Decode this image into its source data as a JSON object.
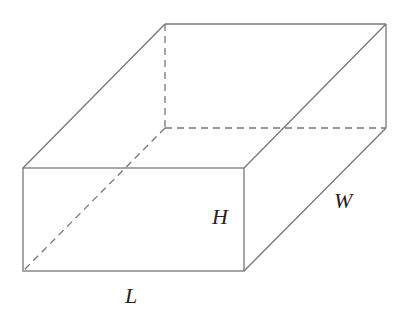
{
  "diagram": {
    "colors": {
      "edge": "#777777",
      "label": "#222222"
    },
    "vertices": {
      "front_top_left": [
        23,
        168
      ],
      "front_top_right": [
        244,
        168
      ],
      "front_bottom_left": [
        23,
        271
      ],
      "front_bottom_right": [
        244,
        271
      ],
      "back_top_left": [
        165,
        24
      ],
      "back_top_right": [
        386,
        24
      ],
      "back_bottom_left": [
        165,
        128
      ],
      "back_bottom_right": [
        386,
        128
      ]
    },
    "labels": {
      "height": {
        "text": "H",
        "x": 212,
        "y": 224
      },
      "width": {
        "text": "W",
        "x": 334,
        "y": 208
      },
      "length": {
        "text": "L",
        "x": 125,
        "y": 303
      }
    },
    "hidden_edges": [
      "back_bottom_left-back_top_left",
      "back_bottom_left-back_bottom_right",
      "back_bottom_left-front_bottom_left"
    ]
  }
}
